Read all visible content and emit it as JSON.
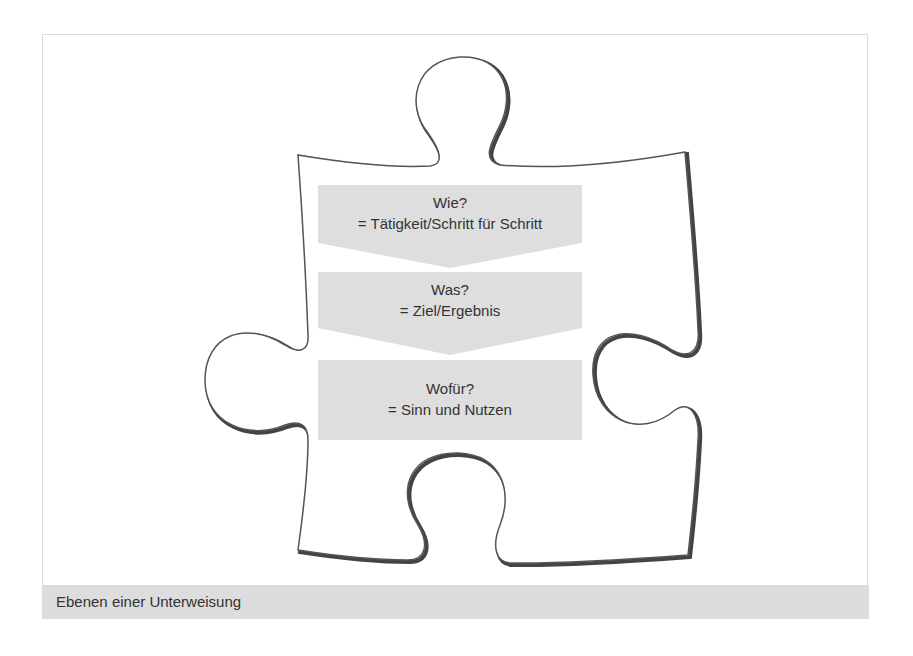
{
  "figure": {
    "caption": "Ebenen einer Unterweisung",
    "colors": {
      "box_fill": "#dedede",
      "outline": "#555555",
      "shadow": "#444444",
      "caption_bg": "#dddddd",
      "text": "#333333"
    },
    "steps": [
      {
        "question": "Wie?",
        "answer": "= Tätigkeit/Schritt für Schritt",
        "shape": "chevron-down"
      },
      {
        "question": "Was?",
        "answer": "= Ziel/Ergebnis",
        "shape": "chevron-down"
      },
      {
        "question": "Wofür?",
        "answer": "= Sinn und Nutzen",
        "shape": "rectangle"
      }
    ]
  }
}
